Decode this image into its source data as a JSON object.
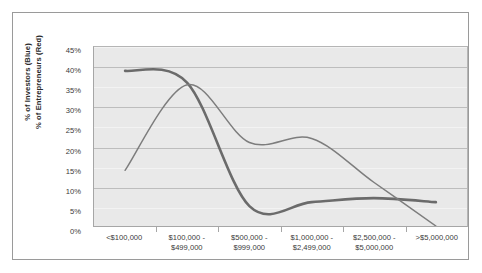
{
  "chart_data": {
    "type": "line",
    "title": "",
    "xlabel": "",
    "ylabel": "% of Investors (Blue)\n% of Entrepreneurs (Red)",
    "ylabel_line1": "% of Investors (Blue)",
    "ylabel_line2": "% of Entrepreneurs (Red)",
    "categories": [
      "<$100,000",
      "$100,000 -\n$499,000",
      "$500,000 -\n$999,000",
      "$1,000,000 -\n$2,499,000",
      "$2,500,000 -\n$5,000,000",
      ">$5,000,000"
    ],
    "series": [
      {
        "name": "% of Investors (Blue)",
        "color": "#6b6b6b",
        "width": 2.6,
        "values": [
          39,
          36,
          5,
          6,
          7,
          6
        ]
      },
      {
        "name": "% of Entrepreneurs (Red)",
        "color": "#7d7d7d",
        "width": 1.5,
        "values": [
          14,
          35.5,
          21,
          22,
          11,
          0
        ]
      }
    ],
    "ylim": [
      0,
      45
    ],
    "ytick_values": [
      0,
      5,
      10,
      15,
      20,
      25,
      30,
      35,
      40,
      45
    ],
    "ytick_labels": [
      "0%",
      "5%",
      "10%",
      "15%",
      "20%",
      "25%",
      "30%",
      "35%",
      "40%",
      "45%"
    ],
    "grid": true,
    "legend": "none",
    "plot_background": "#e9e9e9",
    "gridline_color": "#f3f3f3",
    "axis_color": "#a6a6a6",
    "frame_color": "#9a9a9a"
  }
}
